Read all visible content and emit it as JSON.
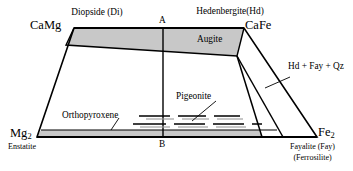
{
  "figure": {
    "type": "pyroxene-quadrilateral-phase-diagram",
    "width": 353,
    "height": 171,
    "background": "#ffffff",
    "line_color": "#000000",
    "shade_color": "#c8c8c8"
  },
  "corners": {
    "top_left": {
      "mineral": "Diopside (Di)",
      "formula": "CaMg",
      "formula_sub": ""
    },
    "top_right": {
      "mineral": "Hedenbergite(Hd)",
      "formula": "CaFe",
      "formula_sub": ""
    },
    "bottom_left": {
      "formula": "Mg",
      "formula_sub": "2",
      "mineral": "Enstatite"
    },
    "bottom_right": {
      "formula": "Fe",
      "formula_sub": "2",
      "mineral_line1": "Fayalite (Fay)",
      "mineral_line2": "(Ferrosilite)"
    }
  },
  "axis_markers": {
    "top": "A",
    "bottom": "B"
  },
  "fields": {
    "augite": "Augite",
    "pigeonite": "Pigeonite",
    "orthopyroxene": "Orthopyroxene",
    "assemblage_right": "Hd + Fay + Qz"
  },
  "geometry": {
    "trapezoid": {
      "top_left": [
        74,
        28
      ],
      "top_right": [
        244,
        28
      ],
      "bottom_right": [
        317,
        137
      ],
      "bottom_left": [
        37,
        137
      ]
    },
    "vertical_divider_x": 163,
    "augite_lower_left": [
      66,
      45
    ],
    "augite_lower_right": [
      237,
      56
    ],
    "pigeonite_wedge_apex": [
      237,
      56
    ],
    "pigeonite_wedge_base_left": [
      262,
      137
    ],
    "pigeonite_wedge_base_right": [
      283,
      137
    ],
    "opx_band_top_y": 130,
    "opx_band_bottom_y": 137,
    "opx_band_right_x": 277,
    "pigeonite_dash_rows_y": [
      116,
      124
    ]
  }
}
